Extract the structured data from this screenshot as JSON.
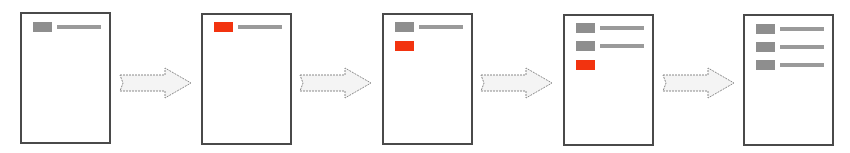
{
  "diagram": {
    "colors": {
      "frame": "#4a4a4a",
      "existing_item": "#8e8e8e",
      "new_item": "#f2330f",
      "text_line": "#9a9a9a",
      "arrow_fill": "#f4f4f4",
      "arrow_stroke": "#8a8a8a"
    },
    "steps": [
      {
        "index": 1,
        "items": [
          {
            "type": "existing",
            "has_line": true
          }
        ]
      },
      {
        "index": 2,
        "items": [
          {
            "type": "new",
            "has_line": true
          }
        ]
      },
      {
        "index": 3,
        "items": [
          {
            "type": "existing",
            "has_line": true
          },
          {
            "type": "new",
            "has_line": false
          }
        ]
      },
      {
        "index": 4,
        "items": [
          {
            "type": "existing",
            "has_line": true
          },
          {
            "type": "existing",
            "has_line": true
          },
          {
            "type": "new",
            "has_line": false
          }
        ]
      },
      {
        "index": 5,
        "items": [
          {
            "type": "existing",
            "has_line": true
          },
          {
            "type": "existing",
            "has_line": true
          },
          {
            "type": "existing",
            "has_line": true
          }
        ]
      }
    ],
    "arrows": [
      {
        "from": 1,
        "to": 2,
        "icon": "right-arrow-icon"
      },
      {
        "from": 2,
        "to": 3,
        "icon": "right-arrow-icon"
      },
      {
        "from": 3,
        "to": 4,
        "icon": "right-arrow-icon"
      },
      {
        "from": 4,
        "to": 5,
        "icon": "right-arrow-icon"
      }
    ]
  }
}
